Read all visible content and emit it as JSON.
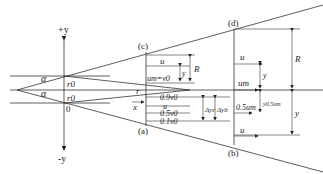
{
  "diagram": {
    "type": "free jet flow structure",
    "axes": {
      "y_pos": "+y",
      "y_neg": "-y",
      "x": "x",
      "origin": "0",
      "radius": "r"
    },
    "nozzle": {
      "r0_top": "r0",
      "r0_bottom": "r0",
      "angle_top": "α",
      "angle_bottom": "α"
    },
    "sections": {
      "c": "(c)",
      "a": "(a)",
      "d": "(d)",
      "b": "(b)"
    },
    "initial_section": {
      "u": "u",
      "um_eq": "um=v0",
      "y": "y",
      "R": "R",
      "v09": "0.9v0",
      "u2": "u",
      "v05": "0.5v0",
      "v01": "0.1v0",
      "dyc": "Δyc",
      "dyb": "Δyb"
    },
    "main_section": {
      "u_top": "u",
      "um": "um",
      "half_um": "0.5um",
      "u_bottom": "u",
      "y_top": "y",
      "y05": "y0.5um",
      "R": "R",
      "y_bottom": "y"
    }
  }
}
